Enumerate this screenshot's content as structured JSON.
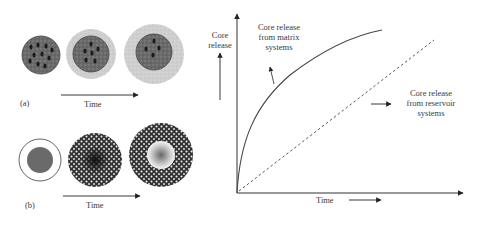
{
  "panel_a": {
    "label": "(a)",
    "time_label": "Time",
    "stages": [
      "matrix core",
      "matrix core with thin coating",
      "matrix core with thick coating"
    ]
  },
  "panel_b": {
    "label": "(b)",
    "time_label": "Time",
    "stages": [
      "reservoir core with shell",
      "reservoir with porous shell",
      "depleted reservoir with porous shell"
    ]
  },
  "graph": {
    "y_axis_label_line1": "Core",
    "y_axis_label_line2": "release",
    "x_axis_label": "Time",
    "matrix_label_line1": "Core release",
    "matrix_label_line2": "from matrix",
    "matrix_label_line3": "systems",
    "reservoir_label_line1": "Core release",
    "reservoir_label_line2": "from reservoir",
    "reservoir_label_line3": "systems"
  },
  "colors": {
    "line": "#4a4a4a",
    "core_dark": "#5a5a5a",
    "coating": "#c8c8c8"
  }
}
